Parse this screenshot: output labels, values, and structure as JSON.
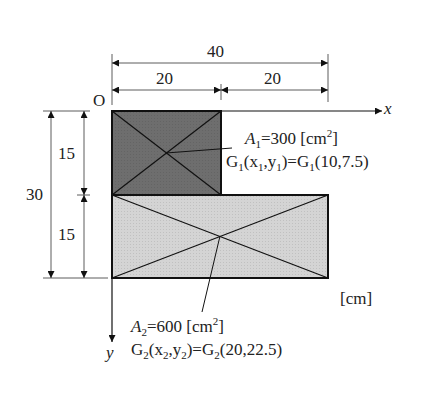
{
  "diagram": {
    "type": "composite-area centroid figure",
    "units_label": "[cm]",
    "origin_label": "O",
    "x_axis_label": "x",
    "y_axis_label": "y",
    "dimensions": {
      "total_width": "40",
      "top_left_width": "20",
      "top_right_width": "20",
      "total_height": "30",
      "upper_height": "15",
      "lower_height": "15"
    },
    "shapes": [
      {
        "id": "A1",
        "fill": "#6b6b6b",
        "area_label": "A",
        "area_sub": "1",
        "area_text": "=300  [cm",
        "area_sup": "2",
        "area_close": "]",
        "centroid_text": "G",
        "centroid_sub": "1",
        "centroid_args": "(x",
        "x_sub": "1",
        "comma_y": ",y",
        "y_sub": "1",
        "eq": ")=G",
        "eq_sub": "1",
        "value": "(10,7.5)"
      },
      {
        "id": "A2",
        "fill": "#d2d2d2",
        "area_label": "A",
        "area_sub": "2",
        "area_text": "=600  [cm",
        "area_sup": "2",
        "area_close": "]",
        "centroid_text": "G",
        "centroid_sub": "2",
        "centroid_args": "(x",
        "x_sub": "2",
        "comma_y": ",y",
        "y_sub": "2",
        "eq": ")=G",
        "eq_sub": "2",
        "value": "(20,22.5)"
      }
    ]
  }
}
